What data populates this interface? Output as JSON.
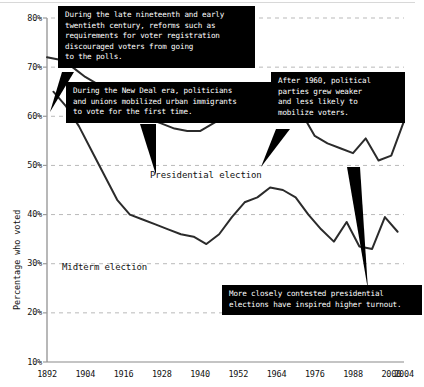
{
  "chart_data": {
    "type": "line",
    "title": "",
    "xlabel": "",
    "ylabel": "Percentage who voted",
    "xlim": [
      1892,
      2004
    ],
    "ylim": [
      10,
      80
    ],
    "grid": true,
    "legend_position": "inline-labels",
    "x_ticks": [
      "1892",
      "1904",
      "1916",
      "1928",
      "1940",
      "1952",
      "1964",
      "1976",
      "1988",
      "2000",
      "2004"
    ],
    "y_ticks": [
      "10%",
      "20%",
      "30%",
      "40%",
      "50%",
      "60%",
      "70%",
      "80%"
    ],
    "series": [
      {
        "name": "Presidential election",
        "x": [
          1892,
          1896,
          1900,
          1904,
          1908,
          1912,
          1916,
          1920,
          1924,
          1928,
          1932,
          1936,
          1940,
          1944,
          1948,
          1952,
          1956,
          1960,
          1964,
          1968,
          1972,
          1976,
          1980,
          1984,
          1988,
          1992,
          1996,
          2000,
          2004
        ],
        "values": [
          72,
          71.5,
          70,
          68,
          66.5,
          64,
          63,
          61,
          59.5,
          58.5,
          57.5,
          57,
          57,
          58.5,
          60,
          62.5,
          62.8,
          63,
          62.8,
          62,
          60.5,
          56,
          54.5,
          53.5,
          52.5,
          55.5,
          51,
          52,
          59
        ]
      },
      {
        "name": "Midterm election",
        "x": [
          1894,
          1898,
          1902,
          1906,
          1910,
          1914,
          1918,
          1922,
          1926,
          1930,
          1934,
          1938,
          1942,
          1946,
          1950,
          1954,
          1958,
          1962,
          1966,
          1970,
          1974,
          1978,
          1982,
          1986,
          1990,
          1994,
          1998,
          2002
        ],
        "values": [
          65,
          62,
          58,
          53,
          48,
          43,
          40,
          39,
          38,
          37,
          36,
          35.5,
          34,
          36,
          39.5,
          42.5,
          43.5,
          45.5,
          45,
          43.5,
          40,
          37,
          34.5,
          38.5,
          33.5,
          33,
          39.5,
          36.5
        ]
      }
    ],
    "series_labels": [
      {
        "text": "Presidential election",
        "x": 150,
        "y": 170
      },
      {
        "text": "Midterm election",
        "x": 62,
        "y": 262
      }
    ],
    "annotations": [
      {
        "id": "annotation-registration-reforms",
        "text": "During the late nineteenth and early\ntwentieth century, reforms such as\nrequirements for voter registration\ndiscouraged voters from going\nto the polls.",
        "box": {
          "left": 58,
          "top": 6,
          "width": 183
        },
        "pointer": {
          "points": "62,72 74,72 50,112"
        }
      },
      {
        "id": "annotation-new-deal-mobilization",
        "text": "During the New Deal era, politicians\nand unions mobilized urban immigrants\nto vote for the first time.",
        "box": {
          "left": 66,
          "top": 82,
          "width": 198
        },
        "pointer": {
          "points": "140,124 156,124 156,175"
        }
      },
      {
        "id": "annotation-parties-grew-weaker",
        "text": "After 1960, political\nparties grew weaker\nand less likely to\nmobilize voters.",
        "box": {
          "left": 271,
          "top": 72,
          "width": 120
        },
        "pointer": {
          "points": "276,129 290,129 261,167"
        }
      },
      {
        "id": "annotation-contested-elections",
        "text": "More closely contested presidential\nelections have inspired higher turnout.",
        "box": {
          "left": 222,
          "top": 285,
          "width": 186
        },
        "pointer": {
          "points": "347,167 360,167 368,290"
        }
      }
    ],
    "colors": {
      "line": "#2b2b2b",
      "grid": "#b9b9b9",
      "axis": "#9a9a9a",
      "callout_bg": "#000000",
      "callout_text": "#ffffff",
      "text": "#111111"
    }
  }
}
